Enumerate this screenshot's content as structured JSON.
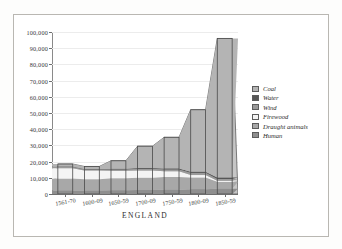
{
  "figure": {
    "running_head": "",
    "caption": "ENGLAND"
  },
  "legend": {
    "position": "right",
    "items": [
      {
        "label": "Coal",
        "color": "#b4b4b4"
      },
      {
        "label": "Water",
        "color": "#565656"
      },
      {
        "label": "Wind",
        "color": "#9a9a9a"
      },
      {
        "label": "Firewood",
        "color": "#f4f4f4"
      },
      {
        "label": "Draught animals",
        "color": "#a8a8a8"
      },
      {
        "label": "Human",
        "color": "#8f8f8f"
      }
    ]
  },
  "axes": {
    "y_ticks": [
      "0",
      "10,000",
      "20,000",
      "30,000",
      "40,000",
      "50,000",
      "60,000",
      "70,000",
      "80,000",
      "90,000",
      "100,000"
    ],
    "x_ticks": [
      "1561-70",
      "1600-09",
      "1650-59",
      "1700-09",
      "1750-59",
      "1800-09",
      "1850-59"
    ]
  },
  "chart_data": {
    "type": "bar",
    "title": "",
    "subtitle": "",
    "xlabel": "ENGLAND",
    "ylabel": "",
    "ylim": [
      0,
      100000
    ],
    "ystep": 10000,
    "grid": true,
    "stacked": true,
    "legend_position": "right",
    "categories": [
      "1561-70",
      "1600-09",
      "1650-59",
      "1700-09",
      "1750-59",
      "1800-09",
      "1850-59"
    ],
    "totals": [
      18500,
      17000,
      20500,
      29500,
      35000,
      52000,
      96000
    ],
    "series": [
      {
        "name": "Human",
        "color": "#8f8f8f",
        "values": [
          2200,
          2100,
          2300,
          2500,
          2700,
          3000,
          3300
        ]
      },
      {
        "name": "Draught animals",
        "color": "#a8a8a8",
        "values": [
          7300,
          7000,
          7400,
          7600,
          7800,
          7200,
          4200
        ]
      },
      {
        "name": "Firewood",
        "color": "#f4f4f4",
        "values": [
          6400,
          5400,
          4600,
          4400,
          3500,
          1500,
          700
        ]
      },
      {
        "name": "Wind",
        "color": "#9a9a9a",
        "values": [
          800,
          700,
          900,
          1100,
          1200,
          1400,
          1100
        ]
      },
      {
        "name": "Water",
        "color": "#565656",
        "values": [
          300,
          300,
          400,
          500,
          600,
          700,
          900
        ]
      },
      {
        "name": "Coal",
        "color": "#b4b4b4",
        "values": [
          1500,
          1500,
          4900,
          13400,
          19200,
          38200,
          85800
        ]
      }
    ]
  },
  "style": {
    "grid_color": "#ececec",
    "axis_color": "#6e6e6e",
    "bar_outline": "#4a4a4a",
    "area_fill": "#c6c6c6",
    "frame_color": "#b9b7b2"
  }
}
